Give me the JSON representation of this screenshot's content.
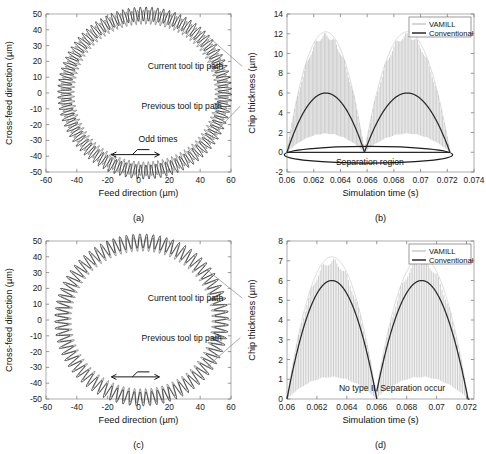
{
  "figure": {
    "panels": [
      "a",
      "b",
      "c",
      "d"
    ]
  },
  "colors": {
    "vamill": "#9b9b9b",
    "conventional": "#2a2a2a",
    "current_path": "#171717",
    "previous_path": "#6e6e6e",
    "axis": "#7d7d7d",
    "frame": "#9a9a9a",
    "leader": "#8a8a8a",
    "background": "#ffffff"
  },
  "chart_data": [
    {
      "id": "a",
      "type": "line",
      "caption": "(a)",
      "title": "",
      "xlabel": "Feed direction (µm)",
      "ylabel": "Cross-feed direction (µm)",
      "xlim": [
        -60,
        60
      ],
      "ylim": [
        -50,
        50
      ],
      "xticks": [
        -60,
        -40,
        -20,
        0,
        20,
        40,
        60
      ],
      "yticks": [
        -50,
        -40,
        -30,
        -20,
        -10,
        0,
        10,
        20,
        30,
        40,
        50
      ],
      "grid": false,
      "legend": null,
      "series": [
        {
          "name": "Previous tool tip path",
          "type": "oscillating-circle",
          "center_x": 4,
          "center_y": 0,
          "radius_x": 50,
          "radius_y": 48,
          "oscillation_amplitude": 4.5,
          "oscillation_cycles": 46,
          "phase": 0.0,
          "color": "#6e6e6e"
        },
        {
          "name": "Current tool tip path",
          "type": "oscillating-circle",
          "center_x": 4,
          "center_y": 0,
          "radius_x": 52,
          "radius_y": 50,
          "oscillation_amplitude": 4.5,
          "oscillation_cycles": 46,
          "phase": 3.14159,
          "color": "#171717"
        }
      ],
      "annotations": [
        {
          "text": "Current tool tip path",
          "x": 6,
          "y": 15,
          "leader_to_x": 46,
          "leader_to_y": 35
        },
        {
          "text": "Previous tool tip path",
          "x": 2,
          "y": -10,
          "leader_to_x": 45,
          "leader_to_y": -30
        },
        {
          "text": "Odd times",
          "x": 0,
          "y": -31,
          "leader_to_x": null,
          "leader_to_y": null
        }
      ],
      "direction_marker": {
        "label": "Odd times",
        "style": "double-arrow-with-step",
        "x_center": -2,
        "y": -39
      }
    },
    {
      "id": "b",
      "type": "line",
      "caption": "(b)",
      "title": "",
      "xlabel": "Simulation time (s)",
      "ylabel": "Chip thickness (µm)",
      "xlim": [
        0.06,
        0.074
      ],
      "ylim": [
        -2,
        14
      ],
      "xticks": [
        0.06,
        0.062,
        0.064,
        0.066,
        0.068,
        0.07,
        0.072,
        0.074
      ],
      "xticklabels": [
        "0.06",
        "0.062",
        "0.064",
        "0.066",
        "0.068",
        "0.07",
        "0.072",
        "0.074"
      ],
      "yticks": [
        -2,
        0,
        2,
        4,
        6,
        8,
        10,
        12,
        14
      ],
      "grid": false,
      "legend": {
        "position": "top-right",
        "entries": [
          "VAMILL",
          "Conventional"
        ]
      },
      "series": [
        {
          "name": "VAMILL",
          "type": "spiky-envelope",
          "color": "#9b9b9b",
          "envelope_peak": 12.2,
          "spike_count": 116,
          "arches": [
            {
              "start": 0.06,
              "end": 0.0658,
              "peak_x": 0.0629,
              "peak": 12.2
            },
            {
              "start": 0.0658,
              "end": 0.0722,
              "peak_x": 0.069,
              "peak": 12.2
            }
          ],
          "baseline": 0
        },
        {
          "name": "Conventional",
          "type": "arch",
          "color": "#2a2a2a",
          "arches": [
            {
              "start": 0.06,
              "end": 0.0658,
              "peak_x": 0.0629,
              "peak": 6.0
            },
            {
              "start": 0.0658,
              "end": 0.0722,
              "peak_x": 0.069,
              "peak": 6.0
            }
          ],
          "baseline": 0
        }
      ],
      "annotations": [
        {
          "text": "Separation region",
          "x": 0.0662,
          "y": -1.25
        }
      ],
      "separation_ellipse": {
        "center_x": 0.0661,
        "center_y": -0.25,
        "radius_x": 0.0063,
        "radius_y": 0.85
      }
    },
    {
      "id": "c",
      "type": "line",
      "caption": "(c)",
      "title": "",
      "xlabel": "Feed direction (µm)",
      "ylabel": "Cross-feed direction (µm)",
      "xlim": [
        -60,
        60
      ],
      "ylim": [
        -50,
        50
      ],
      "xticks": [
        -60,
        -40,
        -20,
        0,
        20,
        40,
        60
      ],
      "yticks": [
        -50,
        -40,
        -30,
        -20,
        -10,
        0,
        10,
        20,
        30,
        40,
        50
      ],
      "grid": false,
      "legend": null,
      "series": [
        {
          "name": "Previous tool tip path",
          "type": "oscillating-circle",
          "center_x": 2,
          "center_y": 0,
          "radius_x": 50,
          "radius_y": 48,
          "oscillation_amplitude": 4.5,
          "oscillation_cycles": 40,
          "phase": 0.0,
          "color": "#6e6e6e"
        },
        {
          "name": "Current tool tip path",
          "type": "oscillating-circle",
          "center_x": 2,
          "center_y": 0,
          "radius_x": 52,
          "radius_y": 50,
          "oscillation_amplitude": 4.5,
          "oscillation_cycles": 40,
          "phase": 0.0,
          "color": "#171717"
        }
      ],
      "annotations": [
        {
          "text": "Current tool tip path",
          "x": 6,
          "y": 12,
          "leader_to_x": 44,
          "leader_to_y": 32
        },
        {
          "text": "Previous tool tip path",
          "x": 2,
          "y": -13,
          "leader_to_x": 44,
          "leader_to_y": -30
        }
      ],
      "direction_marker": {
        "label": "Even times",
        "style": "double-arrow-with-step",
        "x_center": -2,
        "y": -36
      }
    },
    {
      "id": "d",
      "type": "line",
      "caption": "(d)",
      "title": "",
      "xlabel": "Simulation time (s)",
      "ylabel": "Chip thickness (µm)",
      "xlim": [
        0.06,
        0.0725
      ],
      "ylim": [
        0,
        8
      ],
      "xticks": [
        0.06,
        0.062,
        0.064,
        0.066,
        0.068,
        0.07,
        0.072
      ],
      "xticklabels": [
        "0.06",
        "0.062",
        "0.064",
        "0.066",
        "0.068",
        "0.07",
        "0.072"
      ],
      "yticks": [
        0,
        1,
        2,
        3,
        4,
        5,
        6,
        7,
        8
      ],
      "grid": false,
      "legend": {
        "position": "top-right",
        "entries": [
          "VAMILL",
          "Conventional"
        ]
      },
      "series": [
        {
          "name": "VAMILL",
          "type": "spiky-envelope",
          "color": "#9b9b9b",
          "envelope_peak": 7.2,
          "spike_count": 108,
          "arches": [
            {
              "start": 0.06,
              "end": 0.066,
              "peak_x": 0.063,
              "peak": 7.2
            },
            {
              "start": 0.066,
              "end": 0.0722,
              "peak_x": 0.069,
              "peak": 7.2
            }
          ],
          "baseline": 0
        },
        {
          "name": "Conventional",
          "type": "arch",
          "color": "#2a2a2a",
          "arches": [
            {
              "start": 0.06,
              "end": 0.066,
              "peak_x": 0.063,
              "peak": 6.0
            },
            {
              "start": 0.066,
              "end": 0.0722,
              "peak_x": 0.069,
              "peak": 6.0
            }
          ],
          "baseline": 0
        }
      ],
      "annotations": [
        {
          "text": "No type II",
          "x": 0.0647,
          "y": 0.42
        },
        {
          "text": "Separation occur",
          "x": 0.0684,
          "y": 0.42
        }
      ]
    }
  ]
}
